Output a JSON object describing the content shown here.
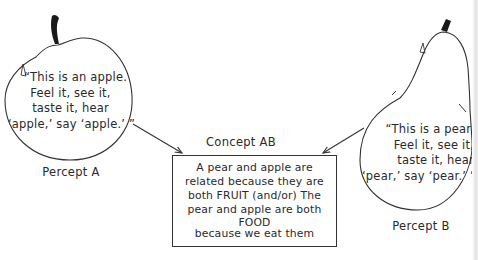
{
  "diagram": {
    "type": "concept-formation",
    "percept_a": {
      "label": "Percept A",
      "shape": "apple",
      "quote_lines": [
        "“This is an apple.",
        "Feel it, see it,",
        "taste it, hear",
        "‘apple,’ say ‘apple.’ ”"
      ]
    },
    "percept_b": {
      "label": "Percept B",
      "shape": "pear",
      "quote_lines": [
        "“This is a pear.",
        "Feel it, see it,",
        "taste it, hear",
        "‘pear,’ say ‘pear.’ ”"
      ]
    },
    "concept": {
      "label": "Concept AB",
      "text_lines": [
        "A pear and apple are",
        "related because they are",
        "both FRUIT (and/or) The",
        "pear and apple are both",
        "FOOD",
        "because we eat them"
      ]
    },
    "edges": [
      {
        "from": "Percept A",
        "to": "Concept AB"
      },
      {
        "from": "Percept B",
        "to": "Concept AB"
      }
    ],
    "colors": {
      "ink": "#2a2a2a",
      "background": "#ffffff"
    }
  }
}
